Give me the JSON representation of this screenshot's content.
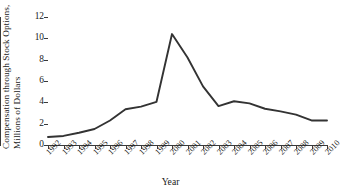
{
  "chart_data": {
    "type": "line",
    "title": "",
    "xlabel": "Year",
    "ylabel": "Compensation through Stock Options, Millions of Dollars",
    "ylabel_lines": [
      "Compensation through Stock Options,",
      "Millions of Dollars"
    ],
    "categories": [
      "1992",
      "1993",
      "1994",
      "1995",
      "1996",
      "1997",
      "1998",
      "1999",
      "2000",
      "2001",
      "2002",
      "2003",
      "2004",
      "2005",
      "2006",
      "2007",
      "2008",
      "2009",
      "2010"
    ],
    "values": [
      0.75,
      0.85,
      1.15,
      1.5,
      2.3,
      3.35,
      3.6,
      4.05,
      10.4,
      8.2,
      5.5,
      3.65,
      4.1,
      3.9,
      3.4,
      3.15,
      2.85,
      2.3,
      2.3
    ],
    "ylim": [
      0,
      12
    ],
    "yticks": [
      0,
      2,
      4,
      6,
      8,
      10,
      12
    ],
    "ytick_labels": [
      "0",
      "2",
      "4",
      "6",
      "8",
      "10",
      "12"
    ],
    "xtick_labels": [
      "1992",
      "1993",
      "1994",
      "1995",
      "1996",
      "1997",
      "1998",
      "1999",
      "2000",
      "2001",
      "2002",
      "2003",
      "2004",
      "2005",
      "2006",
      "2007",
      "2008",
      "2009",
      "2010"
    ],
    "grid": false,
    "legend": false,
    "legend_position": "none",
    "line_color": "#333333",
    "axis_color": "#3a3a3a",
    "background_color": "#ffffff",
    "annotations": []
  }
}
